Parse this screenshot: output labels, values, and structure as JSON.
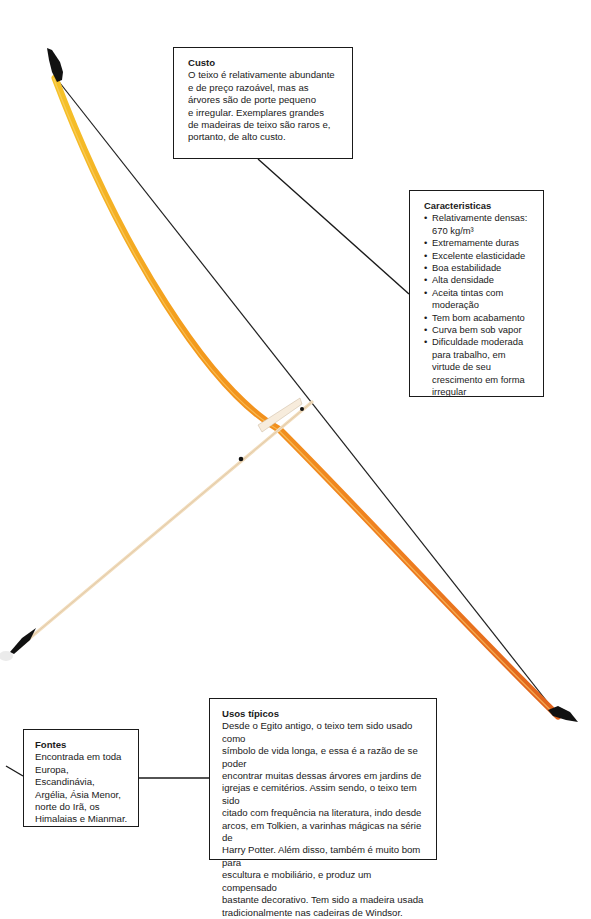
{
  "colors": {
    "bow_top": "#f2b824",
    "bow_mid": "#f08a1a",
    "bow_bottom": "#e06a1c",
    "string": "#222222",
    "tips": "#111111",
    "arrow_shaft": "#f3dfc0",
    "box_border": "#1a1a1a"
  },
  "callouts": {
    "custo": {
      "title": "Custo",
      "lines": [
        "O teixo é relativamente abundante",
        "e de preço razoável, mas as",
        "árvores são de porte pequeno",
        "e irregular. Exemplares grandes",
        "de madeiras de teixo são raros e,",
        "portanto, de alto custo."
      ]
    },
    "caracteristicas": {
      "title": "Caracteristicas",
      "items": [
        "Relativamente densas: 670 kg/m³",
        "Extremamente duras",
        "Excelente elasticidade",
        "Boa estabilidade",
        "Alta densidade",
        "Aceita tintas com moderação",
        "Tem bom acabamento",
        "Curva bem sob vapor",
        "Dificuldade moderada para trabalho, em virtude de seu crescimento em forma irregular"
      ]
    },
    "usos": {
      "title": "Usos típicos",
      "lines": [
        "Desde o Egito antigo, o teixo tem sido usado como",
        "símbolo de vida longa, e essa é a razão de se poder",
        "encontrar muitas dessas árvores em jardins de",
        "igrejas e cemitérios. Assim sendo, o teixo tem sido",
        "citado com frequência na literatura, indo desde",
        "arcos, em Tolkien, a varinhas mágicas na série de",
        "Harry Potter. Além disso, também é muito bom para",
        "escultura e mobiliário, e produz um compensado",
        "bastante decorativo. Tem sido a madeira usada",
        "tradicionalmente nas cadeiras de Windsor."
      ]
    },
    "fontes": {
      "title": "Fontes",
      "lines": [
        "Encontrada em toda",
        "Europa, Escandinávia,",
        "Argélia, Ásia Menor,",
        "norte do Irã, os",
        "Himalaias e Mianmar."
      ]
    }
  }
}
